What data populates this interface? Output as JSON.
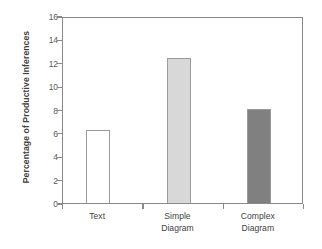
{
  "chart_data": {
    "type": "bar",
    "title": "",
    "subtitle": "",
    "xlabel": "",
    "ylabel": "Percentage of Productive Inferences",
    "categories": [
      "Text",
      "Simple Diagram",
      "Complex Diagram"
    ],
    "category_lines": [
      [
        "Text"
      ],
      [
        "Simple",
        "Diagram"
      ],
      [
        "Complex",
        "Diagram"
      ]
    ],
    "values": [
      6.3,
      12.5,
      8.1
    ],
    "ylim": [
      0,
      16
    ],
    "ytick_values": [
      0,
      2,
      4,
      6,
      8,
      10,
      12,
      14,
      16
    ],
    "ytick_labels": [
      "0",
      "2",
      "4",
      "6",
      "8",
      "10",
      "12",
      "14",
      "16"
    ],
    "grid": false,
    "legend": false,
    "legend_position": "none",
    "bar_fills": [
      "#ffffff",
      "#d8d8d8",
      "#808080"
    ],
    "bar_edge_color": "#9a9a9a",
    "axis_color": "#8a8a8a",
    "background": "#ffffff"
  }
}
